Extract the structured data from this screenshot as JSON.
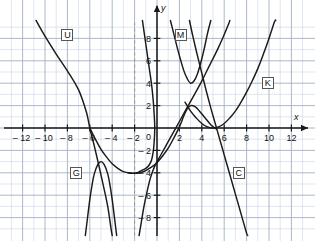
{
  "figure": {
    "kind": "cartesian-coordinate-plot",
    "background_color": "#ffffff",
    "grid_color_minor": "#c9d4e4",
    "grid_color_major": "#9fb0c6",
    "axis_color": "#1a1a1a",
    "curve_color": "#1a1a1a",
    "label_box_border": "#555555"
  },
  "axes": {
    "x_label": "x",
    "y_label": "y",
    "origin_label": "0",
    "x_min": -13.5,
    "x_max": 13.5,
    "y_min": -9.6,
    "y_max": 9.6,
    "unit_px": 11.2,
    "origin_px": {
      "x": 157,
      "y": 128
    },
    "x_ticks": [
      -12,
      -10,
      -8,
      -6,
      -4,
      -2,
      2,
      4,
      6,
      8,
      10,
      12
    ],
    "x_tick_labels": [
      "– 12",
      "– 10",
      "– 8",
      "– 6",
      "– 4",
      "– 2",
      "2",
      "4",
      "6",
      "8",
      "10",
      "12"
    ],
    "y_ticks": [
      8,
      6,
      4,
      2,
      -2,
      -4,
      -6,
      -8
    ],
    "y_tick_labels": [
      "8",
      "6",
      "4",
      "2",
      "– 2",
      "– 4",
      "– 6",
      "– 8"
    ],
    "minor_grid_step": 1,
    "major_grid_step": 2
  },
  "guides": [
    {
      "name": "dashed-vertical-guide",
      "orientation": "vertical",
      "at_x": -2,
      "style": "dashed"
    }
  ],
  "chart_data": {
    "type": "line",
    "title": "",
    "xlabel": "x",
    "ylabel": "y",
    "xlim": [
      -13.5,
      13.5
    ],
    "ylim": [
      -9.6,
      9.6
    ],
    "grid": true,
    "legend": "inline-boxed-labels",
    "series": [
      {
        "name": "U",
        "label": "U",
        "label_pos": {
          "x": -8.0,
          "y": 8.3
        },
        "description": "steep decreasing curve through upper left, crosses x-axis near x = -6",
        "points": [
          [
            -10.8,
            9.6
          ],
          [
            -10.0,
            8.2
          ],
          [
            -9.0,
            6.6
          ],
          [
            -8.0,
            5.1
          ],
          [
            -7.0,
            3.4
          ],
          [
            -6.3,
            1.4
          ],
          [
            -6.0,
            0.0
          ],
          [
            -5.6,
            -1.6
          ],
          [
            -5.2,
            -3.3
          ],
          [
            -4.8,
            -5.1
          ],
          [
            -4.4,
            -7.0
          ],
          [
            -4.1,
            -9.0
          ],
          [
            -4.0,
            -9.6
          ]
        ]
      },
      {
        "name": "M",
        "label": "M",
        "label_pos": {
          "x": 2.1,
          "y": 8.3
        },
        "description": "narrow upward parabola, vertex near (3, 4)",
        "vertex": [
          3,
          4
        ],
        "points": [
          [
            1.2,
            9.6
          ],
          [
            1.5,
            8.4
          ],
          [
            1.8,
            7.2
          ],
          [
            2.1,
            6.1
          ],
          [
            2.4,
            5.1
          ],
          [
            2.7,
            4.4
          ],
          [
            3.0,
            4.0
          ],
          [
            3.3,
            4.2
          ],
          [
            3.6,
            4.8
          ],
          [
            3.9,
            5.8
          ],
          [
            4.2,
            7.0
          ],
          [
            4.5,
            8.4
          ],
          [
            4.8,
            9.6
          ]
        ]
      },
      {
        "name": "K",
        "label": "K",
        "label_pos": {
          "x": 9.9,
          "y": 4.0
        },
        "description": "wide upward parabola, vertex at (5, 0) tangent to x-axis",
        "vertex": [
          5,
          0
        ],
        "points": [
          [
            2.5,
            2.3
          ],
          [
            3.0,
            1.5
          ],
          [
            3.5,
            0.9
          ],
          [
            4.0,
            0.4
          ],
          [
            4.5,
            0.1
          ],
          [
            5.0,
            0.0
          ],
          [
            5.5,
            0.1
          ],
          [
            6.0,
            0.4
          ],
          [
            6.5,
            0.9
          ],
          [
            7.0,
            1.5
          ],
          [
            7.5,
            2.3
          ],
          [
            8.0,
            3.2
          ],
          [
            8.5,
            4.2
          ],
          [
            9.0,
            5.3
          ],
          [
            9.5,
            6.6
          ],
          [
            10.0,
            8.0
          ],
          [
            10.5,
            9.5
          ],
          [
            10.6,
            9.6
          ]
        ]
      },
      {
        "name": "G",
        "label": "G",
        "label_pos": {
          "x": -7.2,
          "y": -4.0
        },
        "description": "narrow downward hump peaking near (-5, -3), falling steeply on both sides",
        "vertex": [
          -5,
          -3
        ],
        "points": [
          [
            -6.4,
            -9.6
          ],
          [
            -6.2,
            -8.0
          ],
          [
            -6.0,
            -6.4
          ],
          [
            -5.8,
            -5.1
          ],
          [
            -5.6,
            -4.1
          ],
          [
            -5.3,
            -3.3
          ],
          [
            -5.0,
            -3.0
          ],
          [
            -4.7,
            -3.3
          ],
          [
            -4.4,
            -4.1
          ],
          [
            -4.2,
            -5.1
          ],
          [
            -4.0,
            -6.4
          ],
          [
            -3.8,
            -8.0
          ],
          [
            -3.6,
            -9.6
          ]
        ]
      },
      {
        "name": "W",
        "label": "",
        "label_pos": null,
        "description": "wide upward parabola, vertex near (-2, -4); rises left toward -6 and right through (0,-3) upward",
        "vertex": [
          -2,
          -4
        ],
        "points": [
          [
            -6.0,
            0.0
          ],
          [
            -5.5,
            -1.0
          ],
          [
            -5.0,
            -1.9
          ],
          [
            -4.5,
            -2.6
          ],
          [
            -4.0,
            -3.2
          ],
          [
            -3.5,
            -3.6
          ],
          [
            -3.0,
            -3.9
          ],
          [
            -2.5,
            -4.0
          ],
          [
            -2.0,
            -4.05
          ],
          [
            -1.5,
            -4.0
          ],
          [
            -1.0,
            -3.8
          ],
          [
            -0.5,
            -3.5
          ],
          [
            0.0,
            -3.1
          ],
          [
            0.5,
            -2.5
          ],
          [
            1.0,
            -1.8
          ],
          [
            1.5,
            -0.9
          ],
          [
            2.0,
            0.1
          ],
          [
            2.4,
            1.1
          ],
          [
            2.7,
            1.7
          ],
          [
            3.0,
            2.0
          ],
          [
            3.4,
            1.9
          ],
          [
            3.8,
            1.5
          ],
          [
            4.3,
            0.9
          ],
          [
            4.8,
            0.3
          ],
          [
            5.3,
            -0.1
          ]
        ]
      },
      {
        "name": "C",
        "label": "C",
        "label_pos": {
          "x": 7.3,
          "y": -4.0
        },
        "description": "steep decreasing curve from upper right area down through lower right",
        "points": [
          [
            2.9,
            9.6
          ],
          [
            3.2,
            8.2
          ],
          [
            3.6,
            6.5
          ],
          [
            4.0,
            4.9
          ],
          [
            4.4,
            3.3
          ],
          [
            4.8,
            1.8
          ],
          [
            5.2,
            0.4
          ],
          [
            5.6,
            -1.0
          ],
          [
            6.0,
            -2.4
          ],
          [
            6.4,
            -3.8
          ],
          [
            6.8,
            -5.2
          ],
          [
            7.2,
            -6.6
          ],
          [
            7.6,
            -8.0
          ],
          [
            8.0,
            -9.4
          ],
          [
            8.1,
            -9.6
          ]
        ]
      },
      {
        "name": "S",
        "label": "",
        "label_pos": null,
        "description": "steep rising curve through lower-left to upper area, passing near (0,-3) and crossing up beyond y=9",
        "points": [
          [
            -1.6,
            -9.6
          ],
          [
            -1.4,
            -8.4
          ],
          [
            -1.2,
            -7.2
          ],
          [
            -1.0,
            -6.2
          ],
          [
            -0.8,
            -5.3
          ],
          [
            -0.6,
            -4.5
          ],
          [
            -0.4,
            -3.9
          ],
          [
            -0.2,
            -3.4
          ],
          [
            0.0,
            -3.0
          ],
          [
            0.4,
            -2.3
          ],
          [
            0.9,
            -1.4
          ],
          [
            1.4,
            -0.5
          ],
          [
            1.9,
            0.4
          ],
          [
            2.4,
            1.3
          ],
          [
            2.9,
            2.2
          ],
          [
            3.4,
            3.1
          ],
          [
            3.9,
            4.0
          ],
          [
            4.4,
            5.0
          ],
          [
            4.9,
            6.0
          ],
          [
            5.4,
            7.0
          ],
          [
            5.9,
            8.1
          ],
          [
            6.4,
            9.3
          ],
          [
            6.5,
            9.6
          ]
        ]
      },
      {
        "name": "D",
        "label": "",
        "label_pos": null,
        "description": "steep near-vertical decreasing branch just left of the y-axis in the upper region",
        "points": [
          [
            -1.3,
            9.6
          ],
          [
            -1.1,
            8.2
          ],
          [
            -0.9,
            6.8
          ],
          [
            -0.7,
            5.4
          ],
          [
            -0.5,
            4.0
          ],
          [
            -0.35,
            2.6
          ],
          [
            -0.25,
            1.2
          ],
          [
            -0.2,
            0.0
          ],
          [
            -0.25,
            -1.2
          ],
          [
            -0.35,
            -2.2
          ],
          [
            -0.5,
            -2.9
          ],
          [
            -0.7,
            -3.3
          ],
          [
            -1.0,
            -3.6
          ],
          [
            -1.4,
            -3.8
          ],
          [
            -1.8,
            -4.0
          ],
          [
            -2.2,
            -4.05
          ],
          [
            -2.6,
            -4.0
          ]
        ]
      }
    ]
  },
  "labels": [
    {
      "id": "U",
      "text": "U"
    },
    {
      "id": "M",
      "text": "M"
    },
    {
      "id": "K",
      "text": "K"
    },
    {
      "id": "G",
      "text": "G"
    },
    {
      "id": "C",
      "text": "C"
    }
  ]
}
